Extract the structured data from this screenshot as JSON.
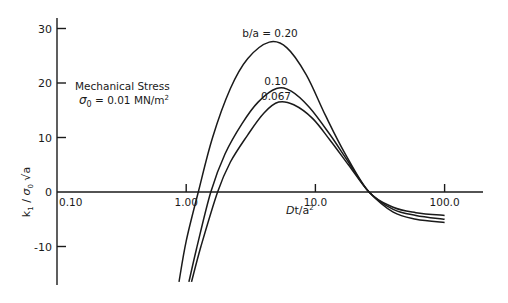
{
  "chart_data": {
    "type": "line",
    "title": "",
    "xlabel": "Dt/a²",
    "ylabel": "k₁/σ₀√a",
    "xscale": "log",
    "xlim": [
      0.1,
      200
    ],
    "ylim": [
      -17,
      32
    ],
    "x_ticks": [
      "0.10",
      "1.00",
      "10.0",
      "100.0"
    ],
    "y_ticks": [
      "30",
      "20",
      "10",
      "0",
      "-10"
    ],
    "annotation": {
      "line1": "Mechanical Stress",
      "line2": "σ₀ = 0.01 MN/m²"
    },
    "series": [
      {
        "name": "b/a = 0.20",
        "label": "b/a = 0.20",
        "x": [
          0.88,
          1.0,
          1.24,
          1.6,
          2.2,
          3.0,
          4.4,
          6.0,
          8.5,
          12,
          17,
          26,
          40,
          60,
          100
        ],
        "y": [
          -16.5,
          -9,
          0,
          10,
          19,
          24.5,
          27.5,
          26.5,
          21.5,
          14,
          7,
          0,
          -2.8,
          -3.8,
          -4.3
        ]
      },
      {
        "name": "b/a = 0.10",
        "label": "0.10",
        "x": [
          1.05,
          1.2,
          1.55,
          2.0,
          2.7,
          3.6,
          5.0,
          6.5,
          9,
          13,
          18,
          26,
          40,
          60,
          100
        ],
        "y": [
          -16.5,
          -10.5,
          0,
          7,
          12.5,
          16.5,
          19,
          18.5,
          15.5,
          10.5,
          5.5,
          0,
          -3.2,
          -4.3,
          -5.0
        ]
      },
      {
        "name": "b/a = 0.067",
        "label": "0.067",
        "x": [
          1.1,
          1.3,
          1.75,
          2.2,
          3.0,
          4.0,
          5.2,
          6.8,
          9.5,
          13,
          18,
          26,
          40,
          60,
          100
        ],
        "y": [
          -16.5,
          -10,
          0,
          5.5,
          10.5,
          14.5,
          16.5,
          16,
          13.5,
          9.5,
          5,
          0,
          -3.7,
          -5.0,
          -5.6
        ]
      }
    ]
  }
}
